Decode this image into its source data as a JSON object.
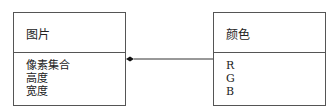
{
  "classes": [
    {
      "name": "图片",
      "attributes": [
        "像素集合",
        "高度",
        "宽度"
      ]
    },
    {
      "name": "颜色",
      "attributes": [
        "R",
        "G",
        "B"
      ]
    }
  ],
  "relationship": {
    "type": "composition",
    "from": "图片",
    "to": "颜色",
    "diamond_end": "图片"
  }
}
